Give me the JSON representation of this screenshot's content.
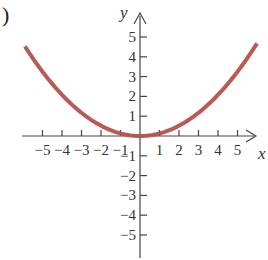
{
  "panel_label": ")",
  "chart_data": {
    "type": "line",
    "title": "",
    "xlabel": "x",
    "ylabel": "y",
    "xlim": [
      -6,
      6.5
    ],
    "ylim": [
      -6,
      6.5
    ],
    "x_ticks": [
      -5,
      -4,
      -3,
      -2,
      -1,
      1,
      2,
      3,
      4,
      5
    ],
    "y_ticks": [
      -5,
      -4,
      -3,
      -2,
      -1,
      1,
      2,
      3,
      4,
      5
    ],
    "x_tick_labels": [
      "−5",
      "−4",
      "−3",
      "−2",
      "−1",
      "1",
      "2",
      "3",
      "4",
      "5"
    ],
    "y_tick_labels": [
      "−5",
      "−4",
      "−3",
      "−2",
      "−1",
      "1",
      "2",
      "3",
      "4",
      "5"
    ],
    "grid": false,
    "legend": null,
    "series": [
      {
        "name": "parabola",
        "color": "#b5524c",
        "function": "y = 0.13 x^2",
        "x": [
          -5.9,
          -5,
          -4,
          -3,
          -2,
          -1,
          0,
          1,
          2,
          3,
          4,
          5,
          6.0
        ],
        "y": [
          4.53,
          3.25,
          2.08,
          1.17,
          0.52,
          0.13,
          0,
          0.13,
          0.52,
          1.17,
          2.08,
          3.25,
          4.68
        ]
      }
    ]
  },
  "style": {
    "axis_color": "#444444",
    "curve_color": "#b5524c"
  }
}
